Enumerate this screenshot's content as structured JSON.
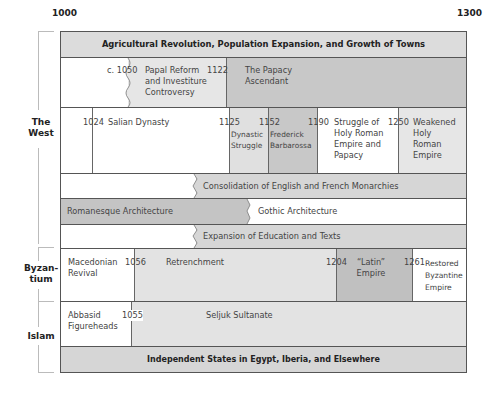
{
  "axis": {
    "start": "1000",
    "end": "1300"
  },
  "groups": {
    "west": "The\nWest",
    "west_l1": "The",
    "west_l2": "West",
    "byz_l1": "Byzan-",
    "byz_l2": "tium",
    "islam": "Islam"
  },
  "rows": {
    "agricultural": "Agricultural Revolution, Population Expansion, and Growth of Towns",
    "papal": {
      "year1": "c. 1050",
      "label1": [
        "Papal Reform",
        "and Investiture",
        "Controversy"
      ],
      "year2": "1122",
      "label2": [
        "The Papacy",
        "Ascendant"
      ]
    },
    "salian": {
      "year1": "1024",
      "label1": "Salian Dynasty",
      "year2": "1125",
      "label2": [
        "Dynastic",
        "Struggle"
      ],
      "year3": "1152",
      "label3": [
        "Frederick",
        "Barbarossa"
      ],
      "year4": "1190",
      "label4": [
        "Struggle of",
        "Holy Roman",
        "Empire and",
        "Papacy"
      ],
      "year5": "1250",
      "label5": [
        "Weakened",
        "Holy",
        "Roman",
        "Empire"
      ]
    },
    "consolidation": "Consolidation of English and French Monarchies",
    "architecture": {
      "romanesque": "Romanesque Architecture",
      "gothic": "Gothic Architecture"
    },
    "education": "Expansion of Education and Texts",
    "byzantium": {
      "label1": [
        "Macedonian",
        "Revival"
      ],
      "year1": "1056",
      "label2": "Retrenchment",
      "year2": "1204",
      "label3": [
        "“Latin”",
        "Empire"
      ],
      "year3": "1261",
      "label4": [
        "Restored",
        "Byzantine",
        "Empire"
      ]
    },
    "islam": {
      "label1": [
        "Abbasid",
        "Figureheads"
      ],
      "year1": "1055",
      "label2": "Seljuk Sultanate"
    },
    "independent": "Independent States in Egypt, Iberia, and Elsewhere"
  },
  "colors": {
    "light": "#e6e6e6",
    "medium": "#d2d2d2",
    "dark": "#b9b9b9",
    "white": "#ffffff",
    "border": "#555555"
  }
}
